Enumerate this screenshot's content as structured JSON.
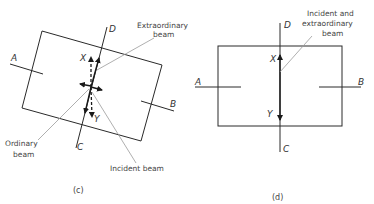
{
  "panel_c": {
    "caption": "(c)",
    "labels": {
      "A": "A",
      "B": "B",
      "C": "C",
      "D": "D",
      "X": "X",
      "Y": "Y"
    },
    "annotations": {
      "extraordinary_1": "Extraordinary",
      "extraordinary_2": "beam",
      "ordinary_1": "Ordinary",
      "ordinary_2": "beam",
      "incident": "Incident beam"
    }
  },
  "panel_d": {
    "caption": "(d)",
    "labels": {
      "A": "A",
      "B": "B",
      "C": "C",
      "D": "D",
      "X": "X",
      "Y": "Y"
    },
    "annotations": {
      "line_1": "Incident and",
      "line_2": "extraordinary",
      "line_3": "beam"
    }
  },
  "colors": {
    "line": "#2a2a2a",
    "leader": "#9a9a9a",
    "text": "#444444"
  }
}
